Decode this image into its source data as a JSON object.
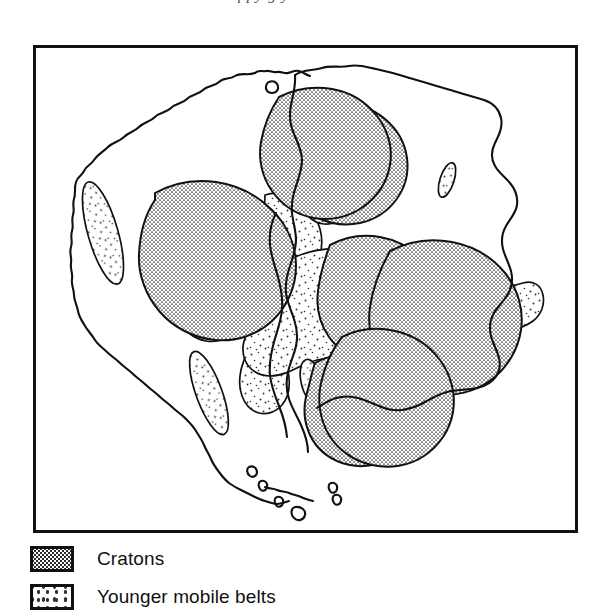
{
  "page": {
    "background_color": "#ffffff",
    "ink_color": "#111111",
    "cropped_text_above_figure": "ppy g y"
  },
  "figure": {
    "name": "gondwana-reconstruction-map",
    "frame": {
      "x": 33,
      "y": 45,
      "width": 545,
      "height": 488,
      "border_color": "#111111",
      "border_width": 3,
      "fill": "#ffffff"
    }
  },
  "legend": {
    "name": "map-legend",
    "items": [
      {
        "label": "Cratons",
        "pattern": "dense-dot-grid",
        "swatch_fill": "#2b2b2b",
        "swatch_background": "#ffffff"
      },
      {
        "label": "Younger mobile belts",
        "pattern": "sparse-stipple",
        "swatch_fill": "#333333",
        "swatch_background": "#ffffff"
      }
    ]
  },
  "map_geometry": {
    "coastlines": [
      {
        "name": "south-america-outline",
        "path": "M 250 22 C 246 26 242 24 240 28 C 236 30 236 36 232 36 C 228 34 224 36 222 40 C 218 42 216 40 212 44 C 208 44 206 48 202 48 C 198 46 194 50 190 52 C 186 54 184 52 180 56 C 176 56 172 54 168 58 C 164 62 160 60 156 64 C 152 66 148 64 145 68 C 141 72 136 70 132 74 C 128 76 124 74 120 78 C 116 82 112 80 108 84 C 104 86 99 84 96 88 C 92 92 87 90 83 94 C 79 98 74 96 70 100 C 66 104 62 102 58 106 C 54 110 50 108 46 112 C 42 116 38 114 35 118 C 31 122 28 120 25 124 C 22 128 20 132 18 136 C 16 140 18 144 20 148 C 22 152 20 156 18 160 C 16 164 18 168 22 170 C 26 172 24 176 21 180 C 18 184 20 188 24 190 C 28 192 26 196 23 200 C 20 204 22 208 26 210 C 30 212 28 216 26 220 C 24 224 26 228 30 230 C 34 232 34 236 32 240 C 30 244 32 248 36 250 C 40 252 42 256 44 260 C 46 264 50 266 54 268 C 58 270 60 274 62 278 C 64 282 68 284 72 286 C 76 288 80 290 84 292 C 88 294 92 296 96 300 C 100 304 104 306 108 310 C 112 314 116 316 120 320 C 124 324 128 326 132 330 C 136 334 140 336 144 340 C 148 344 152 346 156 350 C 160 354 164 356 168 360 C 172 364 174 368 176 372 C 178 376 180 380 182 384 C 184 388 186 392 188 396 C 190 400 192 404 194 408 C 196 412 198 416 200 420 C 202 424 204 428 207 430 C 210 432 214 432 217 434 C 220 436 222 438 225 440 C 228 442 232 442 235 444 C 238 446 241 448 244 450 C 247 452 251 452 254 453 C 257 454 261 453 264 452 C 267 451 270 449 273 448"
      },
      {
        "name": "africa-outline",
        "path": "M 250 22 C 256 20 262 22 268 20 C 274 18 280 20 286 19 C 292 18 298 20 304 19 C 310 18 316 20 322 22 C 328 24 334 24 340 26 C 346 28 352 30 358 31 C 364 32 370 32 376 34 C 382 36 388 38 394 40 C 400 42 406 42 412 44 C 418 46 424 48 430 50 C 436 52 442 52 448 54 C 454 56 460 58 466 60 C 472 62 478 62 484 64 C 490 66 496 68 502 70 C 508 72 512 76 514 82 C 516 88 514 94 512 100 C 510 106 510 112 510 118 C 510 124 512 130 512 136 C 512 142 510 148 508 154 C 506 160 506 166 506 172 C 506 178 508 184 508 190 C 508 196 506 202 504 208 C 502 214 500 220 498 226 C 496 232 494 238 492 244 C 490 250 486 254 482 258 C 478 262 474 266 470 270 C 466 274 462 278 458 282 C 454 286 448 288 442 290 C 436 292 430 294 424 296 C 418 298 412 300 406 302 C 400 304 394 306 388 308 C 382 310 376 312 370 314 C 364 316 358 318 352 320 C 346 322 340 324 334 326 C 328 328 322 330 316 332 C 310 334 304 336 298 338 C 292 340 286 342 280 344"
      },
      {
        "name": "gondwana-fit-suture",
        "path": "M 250 22 C 250 30 248 38 246 46 C 244 54 244 62 246 70 C 248 78 252 84 256 90 C 260 96 262 102 262 108 C 262 114 260 120 258 126 C 256 132 254 138 252 144 C 250 150 250 156 252 162 C 254 168 256 174 256 180 C 256 186 254 192 252 198 C 250 204 248 210 248 216 C 248 222 250 228 252 234 C 254 240 256 246 256 252 C 256 258 254 264 252 270 C 250 276 250 282 252 288 C 254 294 258 300 262 306 C 266 312 270 318 274 324 C 278 330 280 336 280 342"
      },
      {
        "name": "tierra-del-fuego",
        "path": "M 258 452 C 262 454 266 455 270 456 C 274 457 278 456 282 457 C 286 458 290 460 294 461"
      },
      {
        "name": "falkland-islands",
        "path": "M 312 438 C 316 437 320 439 322 442 C 324 445 322 448 318 449 C 314 450 310 448 309 444 C 308 441 309 439 312 438"
      }
    ],
    "craton_regions": [
      {
        "name": "guiana-shield-craton",
        "approx_center": [
          318,
          120
        ],
        "pattern": "dense"
      },
      {
        "name": "amazonian-craton",
        "approx_center": [
          198,
          205
        ],
        "pattern": "dense"
      },
      {
        "name": "sao-francisco-craton",
        "approx_center": [
          363,
          262
        ],
        "pattern": "dense"
      },
      {
        "name": "rio-de-la-plata-craton",
        "approx_center": [
          331,
          360
        ],
        "pattern": "dense"
      },
      {
        "name": "west-african-craton",
        "approx_center": [
          326,
          118
        ],
        "pattern": "dense"
      },
      {
        "name": "congo-craton",
        "approx_center": [
          430,
          258
        ],
        "pattern": "dense"
      },
      {
        "name": "kalahari-craton",
        "approx_center": [
          400,
          345
        ],
        "pattern": "dense"
      }
    ],
    "mobile_belt_regions": [
      {
        "name": "andean-mobile-belt-north",
        "approx_center": [
          105,
          185
        ],
        "pattern": "sparse"
      },
      {
        "name": "andean-mobile-belt-south",
        "approx_center": [
          175,
          345
        ],
        "pattern": "sparse"
      },
      {
        "name": "brasiliano-mobile-belt",
        "approx_center": [
          280,
          250
        ],
        "pattern": "sparse"
      },
      {
        "name": "pan-african-mobile-belt",
        "approx_center": [
          395,
          300
        ],
        "pattern": "sparse"
      },
      {
        "name": "mauritanide-mobile-belt",
        "approx_center": [
          300,
          165
        ],
        "pattern": "sparse"
      },
      {
        "name": "isolated-belt-ellipse-ne-africa",
        "approx_center": [
          445,
          178
        ],
        "pattern": "sparse"
      }
    ]
  }
}
